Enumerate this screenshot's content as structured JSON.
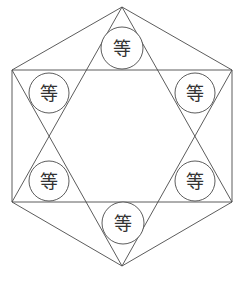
{
  "diagram": {
    "type": "hexagram-in-hexagon",
    "line_color": "#4a4a4a",
    "background": "#ffffff",
    "vertices": {
      "top": [
        122,
        7
      ],
      "upper_right": [
        232,
        70
      ],
      "lower_right": [
        232,
        202
      ],
      "bottom": [
        122,
        266
      ],
      "lower_left": [
        12,
        202
      ],
      "upper_left": [
        12,
        70
      ]
    },
    "nodes": [
      {
        "id": "top",
        "label": "等",
        "cx": 122,
        "cy": 48,
        "r": 21
      },
      {
        "id": "upper-left",
        "label": "等",
        "cx": 49,
        "cy": 93,
        "r": 20
      },
      {
        "id": "upper-right",
        "label": "等",
        "cx": 195,
        "cy": 93,
        "r": 20
      },
      {
        "id": "lower-left",
        "label": "等",
        "cx": 49,
        "cy": 181,
        "r": 20
      },
      {
        "id": "lower-right",
        "label": "等",
        "cx": 195,
        "cy": 181,
        "r": 20
      },
      {
        "id": "bottom",
        "label": "等",
        "cx": 123,
        "cy": 223,
        "r": 21
      }
    ]
  }
}
